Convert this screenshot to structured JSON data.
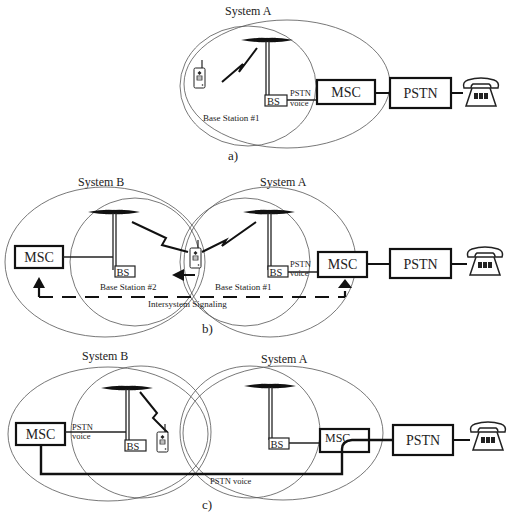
{
  "panels": [
    {
      "id": "a",
      "caption": "a)",
      "systems": [
        {
          "label": "System A"
        }
      ],
      "base_stations": [
        {
          "label": "Base Station #1",
          "box": "BS"
        }
      ],
      "links": [
        {
          "label_line1": "PSTN",
          "label_line2": "voice"
        }
      ],
      "nodes": {
        "msc": "MSC",
        "pstn": "PSTN"
      }
    },
    {
      "id": "b",
      "caption": "b)",
      "systems": [
        {
          "label": "System B"
        },
        {
          "label": "System A"
        }
      ],
      "base_stations": [
        {
          "label": "Base Station #2",
          "box": "BS"
        },
        {
          "label": "Base Station #1",
          "box": "BS"
        }
      ],
      "links": [
        {
          "label_line1": "PSTN",
          "label_line2": "voice"
        }
      ],
      "signaling_label": "Intersystem Signaling",
      "nodes": {
        "msc_left": "MSC",
        "msc_right": "MSC",
        "pstn": "PSTN"
      }
    },
    {
      "id": "c",
      "caption": "c)",
      "systems": [
        {
          "label": "System B"
        },
        {
          "label": "System A"
        }
      ],
      "base_stations": [
        {
          "box": "BS"
        },
        {
          "box": "BS"
        }
      ],
      "links": [
        {
          "label_line1": "PSTN",
          "label_line2": "voice"
        }
      ],
      "bottom_link_label": "PSTN voice",
      "nodes": {
        "msc_left": "MSC",
        "msc_right": "MSC",
        "pstn": "PSTN"
      }
    }
  ],
  "icons": [
    "antenna-icon",
    "mobile-phone-icon",
    "telephone-icon",
    "radio-link-icon",
    "arrow-icon"
  ],
  "colors": {
    "line": "#222222",
    "ellipse": "#555555",
    "background": "#ffffff"
  }
}
